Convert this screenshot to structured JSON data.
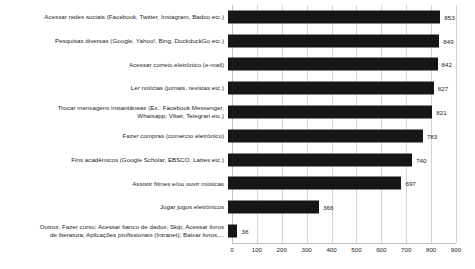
{
  "chart_data": {
    "type": "bar",
    "orientation": "horizontal",
    "title": "",
    "xlabel": "",
    "ylabel": "",
    "xlim": [
      0,
      900
    ],
    "xticks": [
      "0",
      "100",
      "200",
      "300",
      "400",
      "500",
      "600",
      "700",
      "800",
      "900"
    ],
    "grid": "vertical",
    "legend": "none",
    "bar_color": "#161616",
    "gridline_color": "#d4d4d4",
    "background_color": "#ffffff",
    "categories": [
      "Acessar redes sociais (Facebook, Twitter, Instagram, Badoo etc.)",
      "Pesquisas diversas (Google, Yahoo!, Bing, DuckduckGo etc.)",
      "Acessar correio eletrônico (e-mail)",
      "Ler notícias (jornais, revistas etc.)",
      "Trocar mensagens instantâneas (Ex.: Facebook Messenger,\nWhatsapp, Viber, Telegran etc.)",
      "Fazer compras (comércio eletrônico)",
      "Fins acadêmicos (Google Scholar, EBSCO, Lattes etc.)",
      "Assistir filmes e/ou ouvir músicas",
      "Jogar jogos eletrônicos",
      "Outros: Fazer curso; Acessar banco de dados; Skip; Acessar livros\nde literatura; Aplicações profissionais (Intranet); Baixar livros,..."
    ],
    "values": [
      853,
      849,
      842,
      827,
      821,
      783,
      740,
      697,
      366,
      38
    ],
    "value_labels": [
      "853",
      "849",
      "842",
      "827",
      "821",
      "783",
      "740",
      "697",
      "366",
      "38"
    ]
  }
}
